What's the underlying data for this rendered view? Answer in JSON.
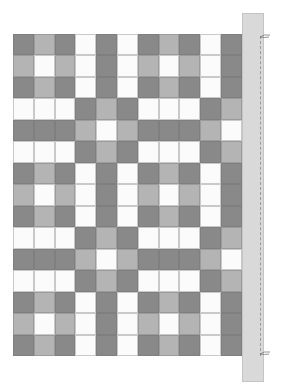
{
  "scene": {
    "description": "Quilt pattern with alternating nine-patch and rail-fence blocks, binding strip with stitch line on right",
    "colors": {
      "dark": "#898989",
      "light": "#b4b4b4",
      "white": "#fbfbfb",
      "binding": "#d9d9d9",
      "stitch": "#9a9a9a"
    },
    "grid": {
      "columns": 11,
      "rows": 15,
      "legend": {
        "D": "dark",
        "L": "light",
        "W": "white"
      },
      "cells": [
        "DLDWDWDLDWD",
        "LWLWDWLWLWD",
        "DLDWDWDLDWD",
        "WWWDLDWWWDL",
        "DDDLWLDDDLW",
        "WWWDLDWWWDL",
        "DLDWDWDLDWD",
        "LWLWDWLWLWD",
        "DLDWDWDLDWD",
        "WWWDLDWWWDL",
        "DDDLWLDDDLW",
        "WWWDLDWWWDL",
        "DLDWDWDLDWD",
        "LWLWDWLWLWD",
        "DLDWDWDLDWD"
      ]
    },
    "binding": {
      "label": ""
    },
    "icons": [
      "thread-top-icon",
      "thread-bottom-icon"
    ]
  }
}
